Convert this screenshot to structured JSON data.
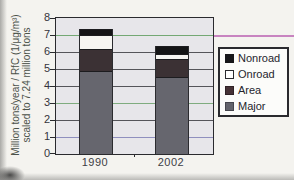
{
  "figure": {
    "y_axis_label_line1": "Million tons/year / RfC (1/μg/m³)",
    "y_axis_label_line2": "scaled to 7.24 million tons"
  },
  "chart_data": {
    "type": "bar",
    "stacked": true,
    "title": "",
    "xlabel": "",
    "ylabel": "Million tons/year / RfC (1/μg/m³) scaled to 7.24 million tons",
    "ylim": [
      0,
      8
    ],
    "y_ticks": [
      0,
      1,
      2,
      3,
      4,
      5,
      6,
      7,
      8
    ],
    "grid": true,
    "categories": [
      "1990",
      "2002"
    ],
    "series": [
      {
        "name": "Major",
        "values": [
          4.9,
          4.5
        ],
        "color": "#66666e"
      },
      {
        "name": "Area",
        "values": [
          1.3,
          1.05
        ],
        "color": "#3b3134"
      },
      {
        "name": "Onroad",
        "values": [
          0.8,
          0.3
        ],
        "color": "#f6f5f2"
      },
      {
        "name": "Nonroad",
        "values": [
          0.35,
          0.45
        ],
        "color": "#141416"
      }
    ],
    "totals": [
      7.35,
      6.3
    ],
    "legend": {
      "position": "right",
      "entries": [
        {
          "label": "Nonroad",
          "fill": "#17171a",
          "border": "#17171a"
        },
        {
          "label": "Onroad",
          "fill": "#ffffff",
          "border": "#2a2a2e"
        },
        {
          "label": "Area",
          "fill": "#463236",
          "border": "#2f2226"
        },
        {
          "label": "Major",
          "fill": "#63636b",
          "border": "#46464e"
        }
      ]
    }
  },
  "colors": {
    "plot_background": "#e7e6ea",
    "grid_default": "#55555a",
    "grid_overrides": {
      "1": "#8f8fbe",
      "3": "#7fac7f",
      "7": "#74a874"
    },
    "artifact_magenta": "#ba5fb0",
    "frame": "#2a2a2e"
  }
}
